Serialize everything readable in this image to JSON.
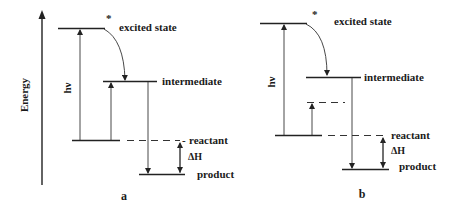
{
  "axis": {
    "label": "Energy"
  },
  "panels": [
    {
      "id": "a",
      "label": "a",
      "levels": {
        "excited": "excited state",
        "intermediate": "intermediate",
        "reactant": "reactant",
        "product": "product"
      },
      "excited_marker": "*",
      "photon_label": "hν",
      "enthalpy_label": "ΔH"
    },
    {
      "id": "b",
      "label": "b",
      "levels": {
        "excited": "excited state",
        "intermediate": "intermediate",
        "reactant": "reactant",
        "product": "product"
      },
      "excited_marker": "*",
      "photon_label": "hν",
      "enthalpy_label": "ΔH"
    }
  ],
  "reactant_prefix": "-"
}
